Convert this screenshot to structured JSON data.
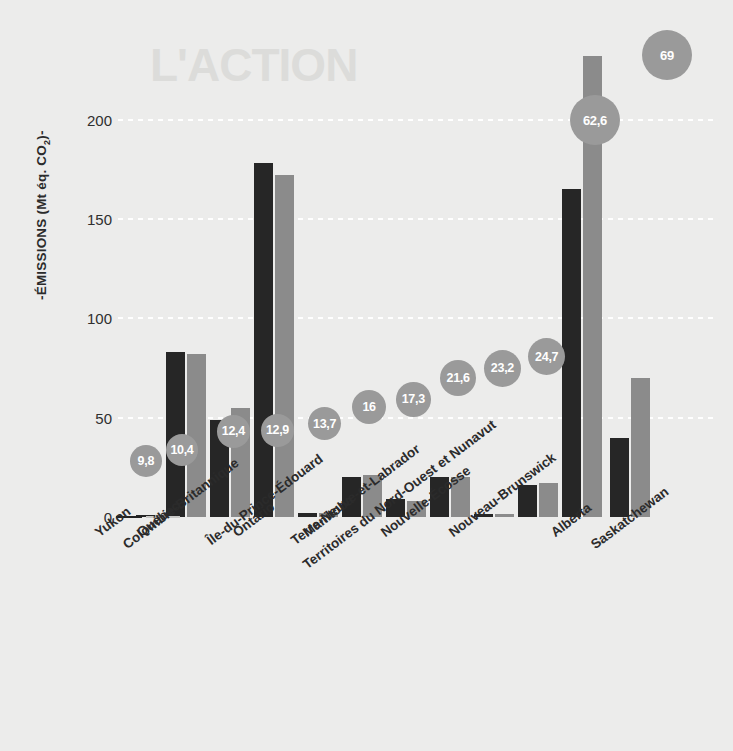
{
  "chart_data": {
    "type": "bar",
    "title": "",
    "xlabel": "",
    "ylabel": "-ÉMISSIONS (Mt éq. CO2)-",
    "ylabel_plain": "-ÉMISSIONS (Mt éq. CO",
    "ylabel_sub": "2",
    "ylabel_tail": ")-",
    "ylim": [
      0,
      240
    ],
    "yticks": [
      0,
      50,
      100,
      150,
      200
    ],
    "ytick_labels": [
      "0",
      "50",
      "100",
      "150",
      "200"
    ],
    "grid": true,
    "legend": "none",
    "categories": [
      "Yukon",
      "Québec",
      "Colombie-Britannique",
      "Ontario",
      "Île-du-Prince-Édouard",
      "Manitoba",
      "Terre-Neuve-et-Labrador",
      "Nouvelle-Écosse",
      "Territoires du Nord-Ouest et Nunavut",
      "Nouveau-Brunswick",
      "Alberta",
      "Saskatchewan"
    ],
    "series": [
      {
        "name": "dark",
        "color": "#262626",
        "values": [
          0.5,
          83,
          49,
          178,
          2,
          20,
          9,
          20,
          1.5,
          16,
          165,
          40
        ]
      },
      {
        "name": "light",
        "color": "#8b8b8b",
        "values": [
          0.5,
          82,
          55,
          172,
          2,
          21,
          8,
          20,
          1.5,
          17,
          232,
          70
        ]
      }
    ],
    "bubbles": {
      "color": "#9a9a9a",
      "text_color": "#ffffff",
      "labels": [
        "9,8",
        "10,4",
        "12,4",
        "12,9",
        "13,7",
        "16",
        "17,3",
        "21,6",
        "23,2",
        "24,7",
        "62,6",
        "69"
      ],
      "values": [
        9.8,
        10.4,
        12.4,
        12.9,
        13.7,
        16,
        17.3,
        21.6,
        23.2,
        24.7,
        62.6,
        69
      ]
    }
  },
  "ghost_headline": "L'ACTION"
}
